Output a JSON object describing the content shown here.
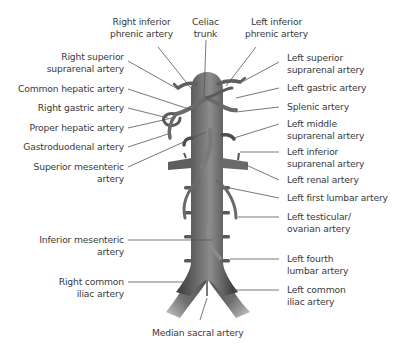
{
  "diagram": {
    "labels_top": [
      {
        "id": "right-inferior-phrenic",
        "line1": "Right inferior",
        "line2": "phrenic artery"
      },
      {
        "id": "celiac-trunk",
        "line1": "Celiac",
        "line2": "trunk"
      },
      {
        "id": "left-inferior-phrenic",
        "line1": "Left inferior",
        "line2": "phrenic artery"
      }
    ],
    "labels_left": [
      {
        "id": "right-superior-suprarenal",
        "line1": "Right superior",
        "line2": "suprarenal artery"
      },
      {
        "id": "common-hepatic",
        "line1": "Common hepatic artery"
      },
      {
        "id": "right-gastric",
        "line1": "Right gastric artery"
      },
      {
        "id": "proper-hepatic",
        "line1": "Proper hepatic artery"
      },
      {
        "id": "gastroduodenal",
        "line1": "Gastroduodenal artery"
      },
      {
        "id": "superior-mesenteric",
        "line1": "Superior mesenteric",
        "line2": "artery"
      },
      {
        "id": "inferior-mesenteric",
        "line1": "Inferior mesenteric",
        "line2": "artery"
      },
      {
        "id": "right-common-iliac",
        "line1": "Right common",
        "line2": "iliac artery"
      }
    ],
    "labels_right": [
      {
        "id": "left-superior-suprarenal",
        "line1": "Left superior",
        "line2": "suprarenal artery"
      },
      {
        "id": "left-gastric",
        "line1": "Left gastric artery"
      },
      {
        "id": "splenic",
        "line1": "Splenic artery"
      },
      {
        "id": "left-middle-suprarenal",
        "line1": "Left middle",
        "line2": "suprarenal artery"
      },
      {
        "id": "left-inferior-suprarenal",
        "line1": "Left inferior",
        "line2": "suprarenal artery"
      },
      {
        "id": "left-renal",
        "line1": "Left renal artery"
      },
      {
        "id": "left-first-lumbar",
        "line1": "Left first lumbar artery"
      },
      {
        "id": "left-testicular-ovarian",
        "line1": "Left testicular/",
        "line2": "ovarian artery"
      },
      {
        "id": "left-fourth-lumbar",
        "line1": "Left fourth",
        "line2": "lumbar artery"
      },
      {
        "id": "left-common-iliac",
        "line1": "Left common",
        "line2": "iliac artery"
      }
    ],
    "labels_bottom": [
      {
        "id": "median-sacral",
        "line1": "Median sacral artery"
      }
    ],
    "colors": {
      "vessel_dark": "#3c3c3c",
      "vessel_mid": "#6e6e6e",
      "vessel_light": "#a8a8a8",
      "leader_line": "#555555",
      "text": "#3a3a3a"
    }
  }
}
